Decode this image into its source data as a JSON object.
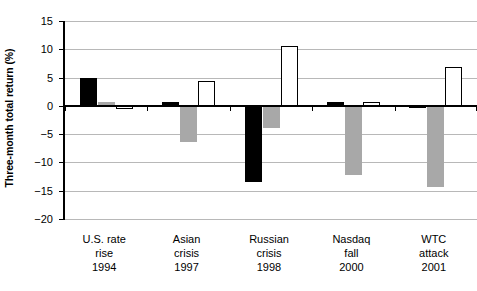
{
  "chart_data": {
    "type": "bar",
    "title": "",
    "xlabel": "",
    "ylabel": "Three-month total return (%)",
    "ylim": [
      -20,
      15
    ],
    "yticks": [
      15,
      10,
      5,
      0,
      -5,
      -10,
      -15,
      -20
    ],
    "ytick_labels": [
      "15",
      "10",
      "5",
      "0",
      "−5",
      "−10",
      "−15",
      "−20"
    ],
    "grid": true,
    "legend": null,
    "categories": [
      {
        "lines": [
          "U.S. rate",
          "rise",
          "1994"
        ]
      },
      {
        "lines": [
          "Asian",
          "crisis",
          "1997"
        ]
      },
      {
        "lines": [
          "Russian",
          "crisis",
          "1998"
        ]
      },
      {
        "lines": [
          "Nasdaq",
          "fall",
          "2000"
        ]
      },
      {
        "lines": [
          "WTC",
          "attack",
          "2001"
        ]
      }
    ],
    "series": [
      {
        "name": "series-black",
        "color": "#000000",
        "values": [
          5.0,
          0.7,
          -13.5,
          0.6,
          -0.4
        ]
      },
      {
        "name": "series-gray",
        "color": "#a8a8a8",
        "values": [
          0.7,
          -6.4,
          -4.0,
          -12.2,
          -14.3
        ]
      },
      {
        "name": "series-white",
        "color": "#ffffff",
        "values": [
          -0.5,
          4.4,
          10.6,
          0.6,
          6.9
        ]
      }
    ]
  }
}
